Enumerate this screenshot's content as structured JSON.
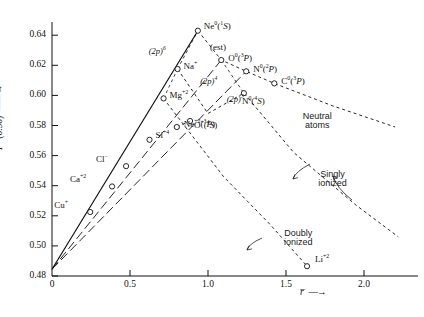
{
  "chart_data": {
    "type": "scatter",
    "title": "",
    "xlabel": "r̄",
    "ylabel": "P* (0.30)",
    "xlim": [
      0,
      2.25
    ],
    "ylim": [
      0.48,
      0.655
    ],
    "xticks": [
      "0",
      "0.5",
      "1.0",
      "1.5",
      "2.0"
    ],
    "xtick_values": [
      0,
      0.5,
      1.0,
      1.5,
      2.0
    ],
    "yticks": [
      "0.48",
      "0.50",
      "0.52",
      "0.54",
      "0.56",
      "0.58",
      "0.60",
      "0.62",
      "0.64"
    ],
    "ytick_values": [
      0.48,
      0.5,
      0.52,
      0.54,
      0.56,
      0.58,
      0.6,
      0.62,
      0.64
    ],
    "grid": false,
    "legend_position": "inline-annotations",
    "origin_value": [
      0.0,
      0.4845
    ],
    "points": [
      {
        "label": "Cu⁺",
        "name": "Cu",
        "charge": "+",
        "term": "",
        "x": 0.245,
        "y": 0.5225,
        "lx": -36,
        "ly": -11
      },
      {
        "label": "Ca⁺²",
        "name": "Ca",
        "charge": "+2",
        "term": "",
        "x": 0.385,
        "y": 0.5395,
        "lx": -42,
        "ly": -11
      },
      {
        "label": "Cl⁻",
        "name": "Cl",
        "charge": "-",
        "term": "",
        "x": 0.475,
        "y": 0.553,
        "lx": -30,
        "ly": -11
      },
      {
        "label": "Si⁺⁴",
        "name": "Si",
        "charge": "+4",
        "term": "",
        "x": 0.625,
        "y": 0.5705,
        "lx": 6,
        "ly": -9
      },
      {
        "label": "Mg⁺²",
        "name": "Mg",
        "charge": "+2",
        "term": "",
        "x": 0.715,
        "y": 0.598,
        "lx": 6,
        "ly": -7
      },
      {
        "label": "Na⁺",
        "name": "Na",
        "charge": "+",
        "term": "",
        "x": 0.805,
        "y": 0.6175,
        "lx": 6,
        "ly": -7
      },
      {
        "label": "Ne⁰(¹S)",
        "name": "Ne",
        "charge": "0",
        "term": "1S",
        "x": 0.935,
        "y": 0.643,
        "lx": 6,
        "ly": -9
      },
      {
        "label": "Ne⁺²(³P)",
        "name": "Ne",
        "charge": "+2",
        "term": "3P",
        "x": 0.8,
        "y": 0.579,
        "lx": 7,
        "ly": -7
      },
      {
        "label": "O⁰(³P)",
        "name": "O",
        "charge": "0",
        "term": "3P",
        "x": 1.085,
        "y": 0.6235,
        "lx": 7,
        "ly": -6
      },
      {
        "label": "O⁺(⁴S)",
        "name": "O",
        "charge": "+",
        "term": "4S",
        "x": 0.885,
        "y": 0.583,
        "lx": 4,
        "ly": 0
      },
      {
        "label": "N⁰(²P)",
        "name": "N",
        "charge": "0",
        "term": "2P",
        "x": 1.245,
        "y": 0.616,
        "lx": 7,
        "ly": -6
      },
      {
        "label": "N⁰(⁴S)",
        "name": "N",
        "charge": "0",
        "term": "4S",
        "x": 1.23,
        "y": 0.6015,
        "lx": -2,
        "ly": 4
      },
      {
        "label": "C⁰(³P)",
        "name": "C",
        "charge": "0",
        "term": "3P",
        "x": 1.425,
        "y": 0.608,
        "lx": 7,
        "ly": -6
      },
      {
        "label": "Li⁺²",
        "name": "Li",
        "charge": "+2",
        "term": "",
        "x": 1.635,
        "y": 0.4865,
        "lx": 8,
        "ly": -11
      }
    ],
    "config_labels": [
      {
        "text": "(2p)⁶",
        "x": 0.62,
        "y": 0.632
      },
      {
        "text": "(2p)⁴",
        "x": 0.95,
        "y": 0.612
      },
      {
        "text": "(2p)³",
        "x": 1.12,
        "y": 0.6005
      }
    ],
    "est_note": "(est)",
    "curve_annotations": [
      {
        "text": "Neutral\natoms",
        "line1": "Neutral",
        "line2": "atoms",
        "x": 1.62,
        "y": 0.589
      },
      {
        "text": "Singly\nionized",
        "line1": "Singly",
        "line2": "ionized",
        "x": 1.72,
        "y": 0.5505
      },
      {
        "text": "Doubly\nionized",
        "line1": "Doubly",
        "line2": "ionized",
        "x": 1.5,
        "y": 0.511
      }
    ],
    "series": [
      {
        "name": "rising-solid-neutral",
        "style": "solid",
        "points": [
          [
            0,
            0.4845
          ],
          [
            0.935,
            0.643
          ]
        ]
      },
      {
        "name": "rising-dashed-singly",
        "style": "dashed",
        "points": [
          [
            0,
            0.4845
          ],
          [
            1.085,
            0.6235
          ]
        ]
      },
      {
        "name": "rising-dashed-doubly",
        "style": "dashed",
        "points": [
          [
            0,
            0.4845
          ],
          [
            1.245,
            0.616
          ]
        ]
      },
      {
        "name": "neutral-atoms-curve",
        "style": "dotted",
        "points": [
          [
            0.935,
            0.643
          ],
          [
            1.085,
            0.6235
          ],
          [
            1.245,
            0.616
          ],
          [
            1.425,
            0.608
          ],
          [
            1.8,
            0.593
          ],
          [
            2.2,
            0.579
          ]
        ]
      },
      {
        "name": "singly-ionized-curve",
        "style": "dotted",
        "points": [
          [
            0.805,
            0.6175
          ],
          [
            1.0,
            0.588
          ],
          [
            1.23,
            0.6015
          ],
          [
            1.55,
            0.562
          ],
          [
            1.95,
            0.527
          ],
          [
            2.22,
            0.506
          ]
        ]
      },
      {
        "name": "doubly-ionized-curve",
        "style": "dotted",
        "points": [
          [
            0.715,
            0.598
          ],
          [
            1.1,
            0.546
          ],
          [
            1.4,
            0.514
          ],
          [
            1.635,
            0.4865
          ]
        ]
      }
    ]
  },
  "axes": {
    "x_axis_name": "r̄",
    "y_axis_name": "P* (0.30)",
    "y_axis_prefix": "P",
    "y_axis_star": "*",
    "y_axis_paren": "(0.30)"
  }
}
